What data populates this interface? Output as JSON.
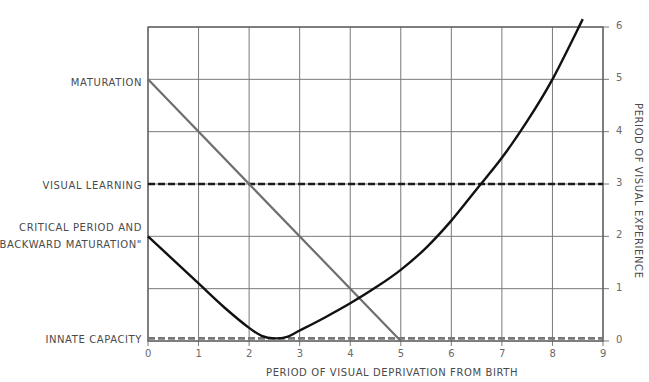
{
  "chart_data": {
    "type": "line",
    "title": "",
    "xlabel": "PERIOD OF VISUAL DEPRIVATION FROM BIRTH",
    "ylabel": "PERIOD OF VISUAL EXPERIENCE",
    "xlim": [
      0,
      9
    ],
    "ylim": [
      0,
      6
    ],
    "x_ticks": [
      "0",
      "1",
      "2",
      "3",
      "4",
      "5",
      "6",
      "7",
      "8",
      "9"
    ],
    "y_ticks": [
      "0",
      "1",
      "2",
      "3",
      "4",
      "5",
      "6"
    ],
    "y_axis_position": "right",
    "grid": true,
    "legend": "none (series labeled at left margin)",
    "series": [
      {
        "name": "MATURATION",
        "style": "solid",
        "color": "#6e6e6e",
        "x": [
          0,
          5
        ],
        "y": [
          5,
          0
        ]
      },
      {
        "name": "VISUAL LEARNING",
        "style": "dashed",
        "color": "#1a1a1a",
        "x": [
          0,
          9
        ],
        "y": [
          3,
          3
        ]
      },
      {
        "name": "CRITICAL PERIOD AND \"BACKWARD MATURATION\"",
        "style": "solid",
        "color": "#111111",
        "x": [
          0,
          0.5,
          1,
          1.5,
          2,
          2.25,
          2.5,
          2.75,
          3,
          3.5,
          4,
          4.5,
          5,
          5.5,
          6,
          6.5,
          7,
          7.5,
          8,
          8.6
        ],
        "y": [
          2,
          1.55,
          1.1,
          0.65,
          0.25,
          0.1,
          0.05,
          0.08,
          0.2,
          0.45,
          0.72,
          1.02,
          1.36,
          1.78,
          2.3,
          2.9,
          3.5,
          4.2,
          5.0,
          6.15
        ]
      },
      {
        "name": "INNATE CAPACITY",
        "style": "dashed",
        "color": "#777777",
        "x": [
          0,
          9
        ],
        "y": [
          0.05,
          0.05
        ]
      }
    ]
  },
  "labels": {
    "maturation": "MATURATION",
    "visual_learning": "VISUAL LEARNING",
    "critical_line1": "CRITICAL PERIOD AND",
    "critical_line2": "\"BACKWARD MATURATION\"",
    "innate_capacity": "INNATE CAPACITY",
    "x_axis_title": "PERIOD OF VISUAL DEPRIVATION FROM BIRTH",
    "y_axis_title": "PERIOD OF VISUAL EXPERIENCE"
  }
}
